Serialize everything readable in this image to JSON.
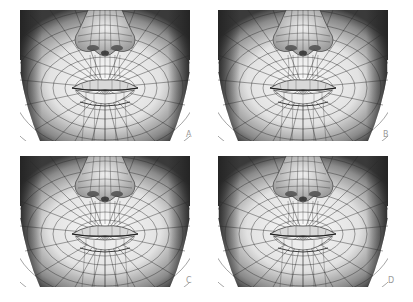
{
  "figure": {
    "panels": [
      {
        "id": "A",
        "label": "A",
        "x": 20,
        "y": 10,
        "label_x": 186,
        "label_y": 133
      },
      {
        "id": "B",
        "label": "B",
        "x": 218,
        "y": 10,
        "label_x": 383,
        "label_y": 133
      },
      {
        "id": "C",
        "label": "C",
        "x": 20,
        "y": 156,
        "label_x": 186,
        "label_y": 279
      },
      {
        "id": "D",
        "label": "D",
        "x": 218,
        "y": 156,
        "label_x": 388,
        "label_y": 279
      }
    ],
    "content_description": "Wireframe 3D mesh renderings of lower human face (nose, lips, chin) — four variants",
    "colors": {
      "background": "#ffffff",
      "mesh_line": "#2a2a2a",
      "shade_dark": "#3a3a3a",
      "shade_light": "#f4f4f4",
      "label": "#9a9a9a"
    }
  }
}
